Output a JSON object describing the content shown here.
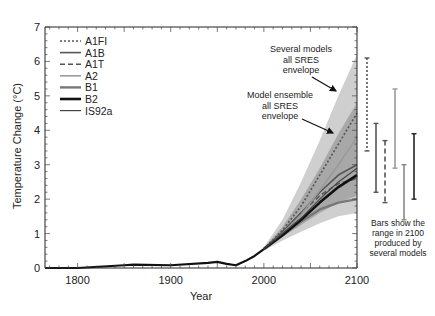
{
  "chart_data": {
    "type": "line",
    "title": "",
    "xlabel": "Year",
    "ylabel": "Temperature Change (°C)",
    "xlim": [
      1765,
      2100
    ],
    "ylim": [
      0,
      7
    ],
    "xticks": [
      1800,
      1900,
      2000,
      2100
    ],
    "yticks": [
      0,
      1,
      2,
      3,
      4,
      5,
      6,
      7
    ],
    "grid": false,
    "legend_position": "upper-left",
    "legend": [
      {
        "name": "A1FI",
        "style": "dotted",
        "color": "#555555",
        "width": 1.6
      },
      {
        "name": "A1B",
        "style": "solid",
        "color": "#555555",
        "width": 1.6
      },
      {
        "name": "A1T",
        "style": "dashed",
        "color": "#555555",
        "width": 1.6
      },
      {
        "name": "A2",
        "style": "solid",
        "color": "#9a9a9a",
        "width": 1.6
      },
      {
        "name": "B1",
        "style": "solid",
        "color": "#777777",
        "width": 2.4
      },
      {
        "name": "B2",
        "style": "solid",
        "color": "#111111",
        "width": 2.6
      },
      {
        "name": "IS92a",
        "style": "solid",
        "color": "#444444",
        "width": 1.2
      }
    ],
    "historical": {
      "x": [
        1765,
        1800,
        1850,
        1860,
        1900,
        1940,
        1950,
        1960,
        1970,
        1980,
        1990,
        2000
      ],
      "values": [
        0.0,
        0.0,
        0.08,
        0.1,
        0.08,
        0.15,
        0.18,
        0.12,
        0.08,
        0.2,
        0.35,
        0.55
      ]
    },
    "x": [
      2000,
      2020,
      2040,
      2060,
      2080,
      2100
    ],
    "series": [
      {
        "name": "A1FI",
        "values": [
          0.55,
          1.1,
          1.8,
          2.7,
          3.6,
          4.5
        ]
      },
      {
        "name": "A1B",
        "values": [
          0.55,
          1.05,
          1.6,
          2.2,
          2.7,
          3.0
        ]
      },
      {
        "name": "A1T",
        "values": [
          0.55,
          1.05,
          1.6,
          2.1,
          2.45,
          2.6
        ]
      },
      {
        "name": "A2",
        "values": [
          0.55,
          1.0,
          1.55,
          2.25,
          3.0,
          3.8
        ]
      },
      {
        "name": "B1",
        "values": [
          0.55,
          0.95,
          1.35,
          1.7,
          1.9,
          2.0
        ]
      },
      {
        "name": "B2",
        "values": [
          0.55,
          0.95,
          1.4,
          1.9,
          2.35,
          2.7
        ]
      },
      {
        "name": "IS92a",
        "values": [
          0.55,
          1.0,
          1.45,
          2.0,
          2.5,
          2.9
        ]
      }
    ],
    "envelopes": [
      {
        "name": "Several models all SRES envelope",
        "color": "#cfcfcf",
        "upper": [
          0.6,
          1.4,
          2.5,
          3.7,
          5.0,
          6.2
        ],
        "lower": [
          0.5,
          0.8,
          1.05,
          1.3,
          1.5,
          1.6
        ]
      },
      {
        "name": "Model ensemble all SRES envelope",
        "color": "#a8a8a8",
        "upper": [
          0.58,
          1.2,
          2.0,
          2.9,
          3.9,
          4.8
        ],
        "lower": [
          0.52,
          0.9,
          1.25,
          1.6,
          1.9,
          2.1
        ]
      }
    ],
    "range_bars_2100": [
      {
        "name": "A1FI",
        "style": "dotted",
        "color": "#555555",
        "low": 3.4,
        "high": 6.1
      },
      {
        "name": "A1B",
        "style": "solid",
        "color": "#555555",
        "low": 2.2,
        "high": 4.2
      },
      {
        "name": "A1T",
        "style": "dashed",
        "color": "#555555",
        "low": 1.9,
        "high": 3.7
      },
      {
        "name": "A2",
        "style": "solid",
        "color": "#9a9a9a",
        "low": 2.9,
        "high": 5.2
      },
      {
        "name": "B1",
        "style": "solid",
        "color": "#888888",
        "low": 1.4,
        "high": 3.0
      },
      {
        "name": "B2",
        "style": "solid",
        "color": "#222222",
        "low": 2.0,
        "high": 3.9
      }
    ],
    "annotations": [
      {
        "text": [
          "Several models",
          "all SRES",
          "envelope"
        ],
        "x": 301,
        "y": 52
      },
      {
        "text": [
          "Model ensemble",
          "all SRES",
          "envelope"
        ],
        "x": 280,
        "y": 98
      },
      {
        "text": [
          "Bars show the",
          "range in 2100",
          "produced by",
          "several models"
        ],
        "x": 398,
        "y": 226
      }
    ]
  }
}
